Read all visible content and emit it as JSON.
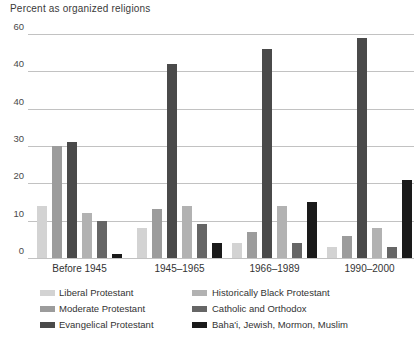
{
  "title": "Percent as organized religions",
  "chart_data": {
    "type": "bar",
    "title": "Percent as organized religions",
    "categories": [
      "Before 1945",
      "1945–1965",
      "1966–1989",
      "1990–2000"
    ],
    "series": [
      {
        "name": "Liberal Protestant",
        "color": "#d3d3d3",
        "values": [
          14,
          8,
          4,
          3
        ]
      },
      {
        "name": "Moderate Protestant",
        "color": "#9c9c9c",
        "values": [
          30,
          13,
          7,
          6
        ]
      },
      {
        "name": "Evangelical Protestant",
        "color": "#4a4a4a",
        "values": [
          31,
          52,
          56,
          59
        ]
      },
      {
        "name": "Historically Black Protestant",
        "color": "#b2b2b2",
        "values": [
          12,
          14,
          14,
          8
        ]
      },
      {
        "name": "Catholic and Orthodox",
        "color": "#666666",
        "values": [
          10,
          9,
          4,
          3
        ]
      },
      {
        "name": "Baha'i, Jewish, Mormon, Muslim",
        "color": "#1a1a1a",
        "values": [
          1,
          4,
          15,
          21
        ]
      }
    ],
    "ylim": [
      0,
      60
    ],
    "ytick_values": [
      0,
      10,
      20,
      30,
      40,
      50,
      60
    ],
    "ytick_labels_rendered": [
      "0",
      "10",
      "20",
      "30",
      "40",
      "40",
      "60"
    ],
    "grid": true,
    "legend_position": "bottom",
    "colors": {
      "background": "#ffffff",
      "gridline": "#c2c2c2",
      "text": "#333333"
    }
  }
}
